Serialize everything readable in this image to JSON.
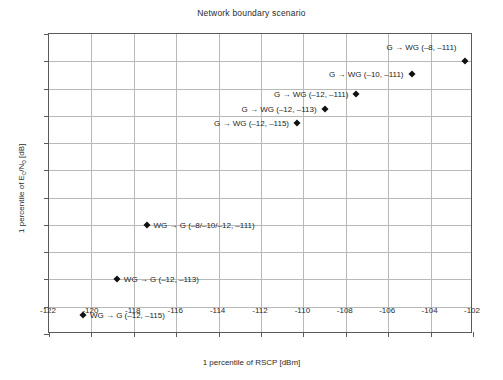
{
  "chart_data": {
    "type": "scatter",
    "title": "Network boundary scenario",
    "xlabel": "1 percentile of RSCP [dBm]",
    "ylabel": "1 percentile of E_c/N_o [dB]",
    "ylabel_parts": {
      "prefix": "1 percentile of E",
      "sub1": "c",
      "mid": "/N",
      "sub2": "o",
      "suffix": " [dB]"
    },
    "xlim": [
      -122,
      -102
    ],
    "ylim": [
      -18,
      -7
    ],
    "xticks": [
      -122,
      -120,
      -118,
      -116,
      -114,
      -112,
      -110,
      -108,
      -106,
      -104,
      -102
    ],
    "xticklabels": [
      "-122",
      "-120",
      "-118",
      "-116",
      "-114",
      "-112",
      "-110",
      "-108",
      "-106",
      "-104",
      "-102"
    ],
    "yticks": [
      -7,
      -8,
      -9,
      -10,
      -11,
      -12,
      -13,
      -14,
      -15,
      -16,
      -17,
      -18
    ],
    "yticklabels": [
      "-7",
      "-8",
      "-9",
      "-10",
      "-11",
      "-12",
      "-13",
      "-14",
      "-15",
      "-16",
      "-17",
      "-18"
    ],
    "grid": true,
    "legend": "none",
    "marker": "diamond",
    "marker_color": "#111111",
    "grid_color": "#b9b9b9",
    "axis_color": "#5a5a5a",
    "points": [
      {
        "label": "G → WG (–8, –111)",
        "x": -102.4,
        "y": -8.0,
        "align": "left",
        "dx": -8,
        "dy": -14
      },
      {
        "label": "G → WG (–10, –111)",
        "x": -104.9,
        "y": -8.45,
        "align": "left",
        "dx": -8,
        "dy": 0
      },
      {
        "label": "G → WG (–12, –111)",
        "x": -107.5,
        "y": -9.2,
        "align": "left",
        "dx": -8,
        "dy": 0
      },
      {
        "label": "G → WG (–12, –113)",
        "x": -109.0,
        "y": -9.75,
        "align": "left",
        "dx": -8,
        "dy": 0
      },
      {
        "label": "G → WG (–12, –115)",
        "x": -110.3,
        "y": -10.25,
        "align": "left",
        "dx": -8,
        "dy": 0
      },
      {
        "label": "WG → G (–8/–10/–12, –111)",
        "x": -117.4,
        "y": -14.0,
        "align": "right",
        "dx": 7,
        "dy": 0
      },
      {
        "label": "WG → G (–12, –113)",
        "x": -118.8,
        "y": -16.0,
        "align": "right",
        "dx": 7,
        "dy": 0
      },
      {
        "label": "WG → G (–12, –115)",
        "x": -120.4,
        "y": -17.3,
        "align": "right",
        "dx": 7,
        "dy": 0
      }
    ]
  }
}
